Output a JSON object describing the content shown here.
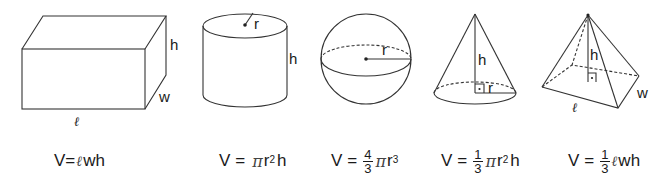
{
  "colors": {
    "stroke": "#333333",
    "text": "#1a1a1a",
    "background": "#ffffff"
  },
  "shapes": [
    {
      "name": "rectangular-prism",
      "labels": {
        "height": "h",
        "width": "w",
        "length": "ℓ"
      },
      "formula": {
        "lhs": "V",
        "eq": "=",
        "rhs": [
          "ℓ",
          "wh"
        ]
      }
    },
    {
      "name": "cylinder",
      "labels": {
        "radius": "r",
        "height": "h"
      },
      "formula": {
        "lhs": "V",
        "eq": "=",
        "pi": "π",
        "base": "r",
        "exp": "2",
        "tail": "h"
      }
    },
    {
      "name": "sphere",
      "labels": {
        "radius": "r"
      },
      "formula": {
        "lhs": "V",
        "eq": "=",
        "num": "4",
        "den": "3",
        "pi": "π",
        "base": "r",
        "exp": "3"
      }
    },
    {
      "name": "cone",
      "labels": {
        "height": "h",
        "radius": "r"
      },
      "formula": {
        "lhs": "V",
        "eq": "=",
        "num": "1",
        "den": "3",
        "pi": "π",
        "base": "r",
        "exp": "2",
        "tail": "h"
      }
    },
    {
      "name": "pyramid",
      "labels": {
        "height": "h",
        "width": "w",
        "length": "ℓ"
      },
      "formula": {
        "lhs": "V",
        "eq": "=",
        "num": "1",
        "den": "3",
        "ell": "ℓ",
        "tail": "wh"
      }
    }
  ]
}
